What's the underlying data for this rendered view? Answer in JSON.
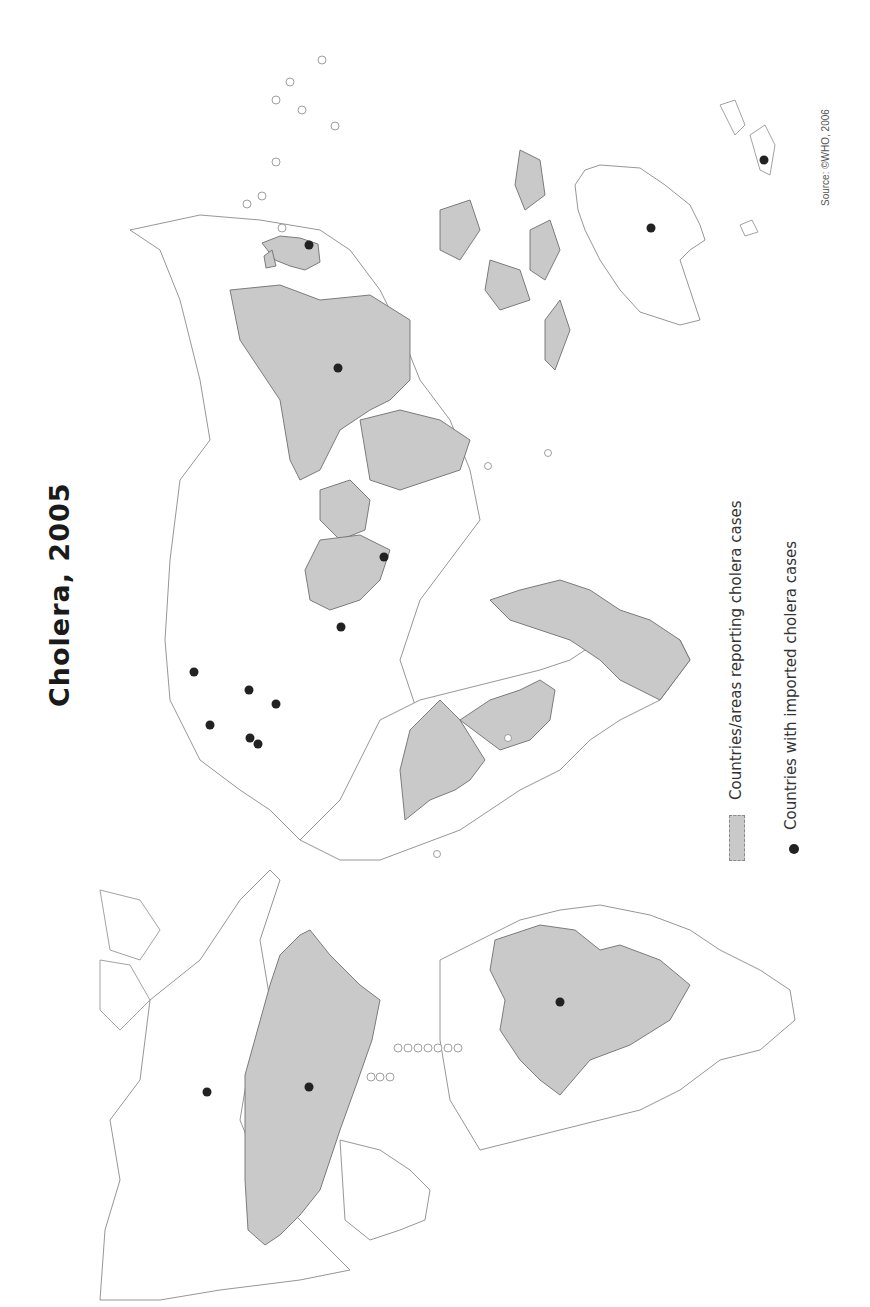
{
  "title": "Cholera, 2005",
  "legend": {
    "items": [
      {
        "label": "Countries/areas reporting cholera cases",
        "symbol": "grey-fill",
        "color": "#c9c9c9"
      },
      {
        "label": "Countries with imported cholera cases",
        "symbol": "black-dot",
        "color": "#222222"
      }
    ]
  },
  "source": "Source: ©WHO, 2006",
  "map": {
    "orientation": "rotated 90 degrees (north to the left)",
    "colors": {
      "reporting": "#c9c9c9",
      "outline": "#8a8a8a",
      "imported_dot": "#222222",
      "background": "#ffffff"
    },
    "regions_reporting": [
      "Canada/North America region",
      "Brazil region",
      "West Africa",
      "Central/East Africa",
      "Middle East/Arabian region",
      "South Asia",
      "China region",
      "Japan/Korea",
      "Southeast Asia islands"
    ],
    "imported_dots": [
      {
        "x": 207,
        "y": 1092
      },
      {
        "x": 309,
        "y": 1087
      },
      {
        "x": 560,
        "y": 1002
      },
      {
        "x": 194,
        "y": 672
      },
      {
        "x": 210,
        "y": 725
      },
      {
        "x": 249,
        "y": 690
      },
      {
        "x": 276,
        "y": 704
      },
      {
        "x": 250,
        "y": 738
      },
      {
        "x": 258,
        "y": 744
      },
      {
        "x": 341,
        "y": 627
      },
      {
        "x": 384,
        "y": 557
      },
      {
        "x": 338,
        "y": 368
      },
      {
        "x": 309,
        "y": 245
      },
      {
        "x": 651,
        "y": 228
      },
      {
        "x": 764,
        "y": 160
      }
    ]
  }
}
